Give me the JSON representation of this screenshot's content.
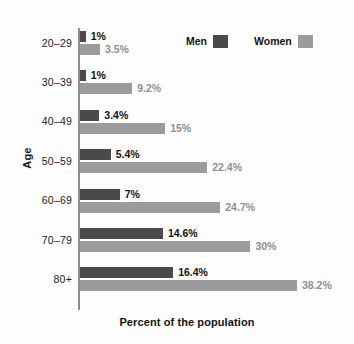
{
  "chart_data": {
    "type": "bar",
    "orientation": "horizontal",
    "title": "",
    "xlabel": "Percent of the population",
    "ylabel": "Age",
    "categories": [
      "20–29",
      "30–39",
      "40–49",
      "50–59",
      "60–69",
      "70–79",
      "80+"
    ],
    "xlim": [
      0,
      38.2
    ],
    "grid": false,
    "legend_position": "top-right",
    "series": [
      {
        "name": "Men",
        "color": "#4a4a4a",
        "values": [
          1,
          1,
          3.4,
          5.4,
          7,
          14.6,
          16.4
        ],
        "labels": [
          "1%",
          "1%",
          "3.4%",
          "5.4%",
          "7%",
          "14.6%",
          "16.4%"
        ]
      },
      {
        "name": "Women",
        "color": "#9b9b9b",
        "values": [
          3.5,
          9.2,
          15,
          22.4,
          24.7,
          30,
          38.2
        ],
        "labels": [
          "3.5%",
          "9.2%",
          "15%",
          "22.4%",
          "24.7%",
          "30%",
          "38.2%"
        ]
      }
    ]
  },
  "legend": {
    "men_label": "Men",
    "women_label": "Women"
  },
  "axes": {
    "y_title": "Age",
    "x_title": "Percent of the population"
  }
}
